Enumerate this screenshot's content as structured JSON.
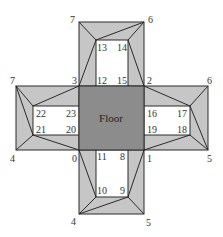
{
  "diagram": {
    "colors": {
      "floor": "#8c8c8c",
      "wall": "#c6c6c6",
      "window": "#ffffff",
      "stroke": "#2a2a2a"
    },
    "floor_label": "Floor",
    "vertices": {
      "v0": "0",
      "v1": "1",
      "v2": "2",
      "v3": "3",
      "v4_left": "4",
      "v5_right": "5",
      "v6_right": "6",
      "v7_left": "7",
      "v4_bottom": "4",
      "v5_bottom": "5",
      "v6_top": "6",
      "v7_top": "7",
      "v8": "8",
      "v9": "9",
      "v10": "10",
      "v11": "11",
      "v12": "12",
      "v13": "13",
      "v14": "14",
      "v15": "15",
      "v16": "16",
      "v17": "17",
      "v18": "18",
      "v19": "19",
      "v20": "20",
      "v21": "21",
      "v22": "22",
      "v23": "23"
    }
  }
}
